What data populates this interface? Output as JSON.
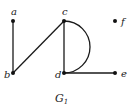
{
  "graph": {
    "caption": "G",
    "caption_subscript": "1",
    "nodes": [
      {
        "id": "a",
        "label": "a",
        "x": 13,
        "y": 21
      },
      {
        "id": "b",
        "label": "b",
        "x": 13,
        "y": 73
      },
      {
        "id": "c",
        "label": "c",
        "x": 64,
        "y": 21
      },
      {
        "id": "d",
        "label": "d",
        "x": 64,
        "y": 73
      },
      {
        "id": "e",
        "label": "e",
        "x": 115,
        "y": 73
      },
      {
        "id": "f",
        "label": "f",
        "x": 115,
        "y": 21
      }
    ],
    "edges": [
      {
        "from": "a",
        "to": "b",
        "type": "straight"
      },
      {
        "from": "b",
        "to": "c",
        "type": "straight"
      },
      {
        "from": "c",
        "to": "d",
        "type": "straight"
      },
      {
        "from": "c",
        "to": "d",
        "type": "arc"
      },
      {
        "from": "d",
        "to": "e",
        "type": "straight"
      }
    ]
  }
}
